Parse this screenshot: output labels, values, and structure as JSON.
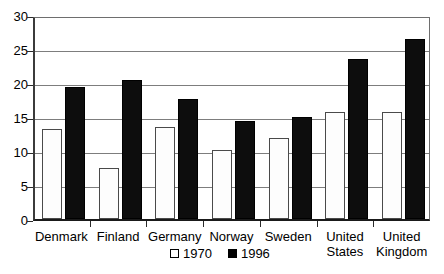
{
  "chart_data": {
    "type": "bar",
    "title": "",
    "subtitle": "",
    "xlabel": "",
    "ylabel": "",
    "ylim": [
      0,
      30
    ],
    "ytick_step": 5,
    "yticks": [
      "0",
      "5",
      "10",
      "15",
      "20",
      "25",
      "30"
    ],
    "grid": true,
    "legend_position": "bottom-center",
    "categories": [
      "Denmark",
      "Finland",
      "Germany",
      "Norway",
      "Sweden",
      "United States",
      "United Kingdom"
    ],
    "category_lines": [
      [
        "Denmark"
      ],
      [
        "Finland"
      ],
      [
        "Germany"
      ],
      [
        "Norway"
      ],
      [
        "Sweden"
      ],
      [
        "United",
        "States"
      ],
      [
        "United",
        "Kingdom"
      ]
    ],
    "series": [
      {
        "name": "1970",
        "color": "#ffffff",
        "values": [
          13.3,
          7.5,
          13.5,
          10.2,
          11.9,
          15.7,
          15.7
        ]
      },
      {
        "name": "1996",
        "color": "#000000",
        "values": [
          19.4,
          20.5,
          17.7,
          14.4,
          15.0,
          23.6,
          26.4
        ]
      }
    ]
  },
  "legend": {
    "items": [
      {
        "label": "1970",
        "swatch": "open-square-swatch"
      },
      {
        "label": "1996",
        "swatch": "filled-square-swatch"
      }
    ]
  }
}
